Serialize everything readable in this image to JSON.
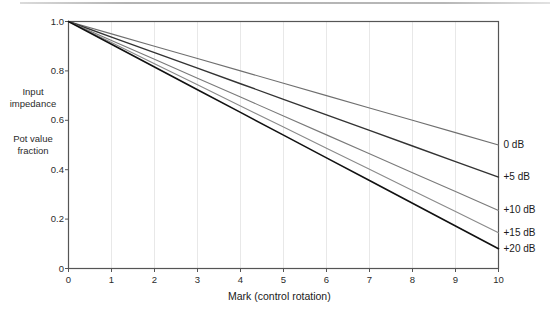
{
  "chart_data": {
    "type": "line",
    "title": "",
    "xlabel": "Mark  (control rotation)",
    "ylabel": "Input impedance / Pot value fraction",
    "ylabel_lines": [
      "Input",
      "impedance",
      "Pot value",
      "fraction"
    ],
    "xlim": [
      0,
      10
    ],
    "ylim": [
      0,
      1.0
    ],
    "xticks": [
      0,
      1,
      2,
      3,
      4,
      5,
      6,
      7,
      8,
      9,
      10
    ],
    "xtick_labels": [
      "0",
      "1",
      "2",
      "3",
      "4",
      "5",
      "6",
      "7",
      "8",
      "9",
      "10"
    ],
    "yticks": [
      0,
      0.2,
      0.4,
      0.6,
      0.8,
      1.0
    ],
    "ytick_labels": [
      "0",
      "0.2",
      "0.4",
      "0.6",
      "0.8",
      "1.0"
    ],
    "grid": "faint vertical gridlines at each integer mark",
    "legend_position": "right of plot, at line end points",
    "x": [
      0,
      1,
      2,
      3,
      4,
      5,
      6,
      7,
      8,
      9,
      10
    ],
    "series": [
      {
        "name": "0 dB",
        "color": "#6f6f6f",
        "width": 1.1,
        "end_value": 0.5,
        "values": [
          1.0,
          0.95,
          0.9,
          0.85,
          0.8,
          0.75,
          0.7,
          0.65,
          0.6,
          0.55,
          0.5
        ]
      },
      {
        "name": "+5 dB",
        "color": "#333333",
        "width": 1.4,
        "end_value": 0.37,
        "values": [
          1.0,
          0.937,
          0.874,
          0.811,
          0.748,
          0.685,
          0.622,
          0.559,
          0.496,
          0.433,
          0.37
        ]
      },
      {
        "name": "+10 dB",
        "color": "#7a7a7a",
        "width": 1.1,
        "end_value": 0.235,
        "values": [
          1.0,
          0.9235,
          0.847,
          0.7705,
          0.694,
          0.6175,
          0.541,
          0.4645,
          0.388,
          0.3115,
          0.235
        ]
      },
      {
        "name": "+15 dB",
        "color": "#8a8a8a",
        "width": 1.1,
        "end_value": 0.145,
        "values": [
          1.0,
          0.9145,
          0.829,
          0.7435,
          0.658,
          0.5725,
          0.487,
          0.4015,
          0.316,
          0.2305,
          0.145
        ]
      },
      {
        "name": "+20 dB",
        "color": "#111111",
        "width": 1.6,
        "end_value": 0.08,
        "values": [
          1.0,
          0.908,
          0.816,
          0.724,
          0.632,
          0.54,
          0.448,
          0.356,
          0.264,
          0.172,
          0.08
        ]
      }
    ]
  },
  "axes": {
    "frame_color": "#555555",
    "grid_color": "#e8e8e8"
  }
}
